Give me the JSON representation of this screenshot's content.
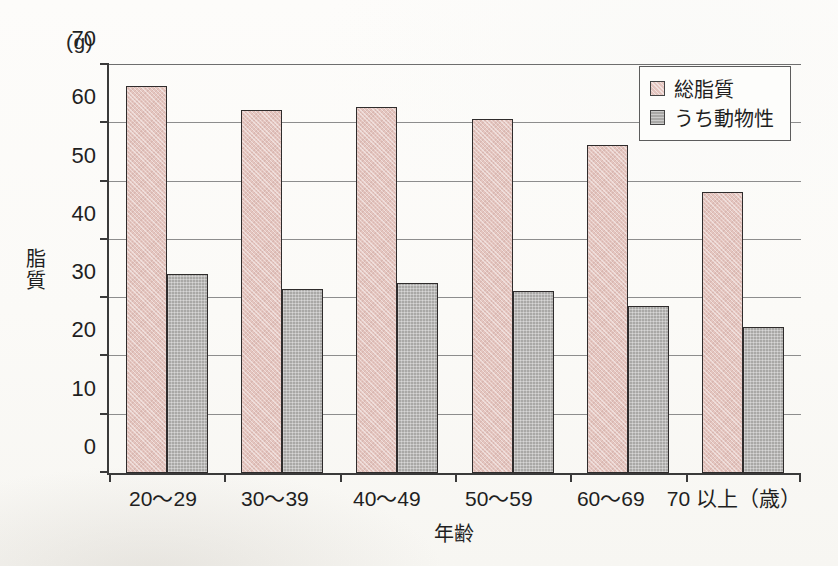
{
  "chart_data": {
    "type": "bar",
    "title": "",
    "unit_label": "(g)",
    "xlabel": "年齢",
    "ylabel": "脂質",
    "ylim": [
      0,
      70
    ],
    "yticks": [
      0,
      10,
      20,
      30,
      40,
      50,
      60,
      70
    ],
    "grid": true,
    "legend_position": "top-right",
    "categories": [
      "20〜29",
      "30〜39",
      "40〜49",
      "50〜59",
      "60〜69",
      "70 以上（歳）"
    ],
    "series": [
      {
        "name": "総脂質",
        "color": "#e4c5bf",
        "values": [
          66,
          62,
          62.5,
          60.5,
          56,
          48
        ]
      },
      {
        "name": "うち動物性",
        "color": "#a9a8a6",
        "values": [
          34,
          31.5,
          32.5,
          31,
          28.5,
          25
        ]
      }
    ]
  },
  "axes": {
    "unit": "(g)",
    "y_title": "脂質",
    "x_title": "年齢",
    "y_tick_labels": [
      "70",
      "60",
      "50",
      "40",
      "30",
      "20",
      "10",
      "0"
    ],
    "x_tick_labels": [
      "20〜29",
      "30〜39",
      "40〜49",
      "50〜59",
      "60〜69",
      "70 以上（歳）"
    ]
  },
  "legend": {
    "items": [
      {
        "label": "総脂質",
        "swatch": "total"
      },
      {
        "label": "うち動物性",
        "swatch": "animal"
      }
    ]
  }
}
